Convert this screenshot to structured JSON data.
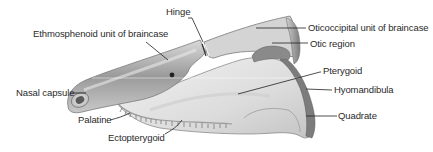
{
  "diagram": {
    "labels": [
      {
        "id": "hinge",
        "text": "Hinge",
        "x": 166,
        "y": 11
      },
      {
        "id": "ethmosphenoid",
        "text": "Ethmosphenoid unit of braincase",
        "x": 33,
        "y": 32
      },
      {
        "id": "oticoccipital",
        "text": "Oticoccipital unit of braincase",
        "x": 308,
        "y": 22
      },
      {
        "id": "otic-region",
        "text": "Otic region",
        "x": 310,
        "y": 38
      },
      {
        "id": "pterygoid",
        "text": "Pterygoid",
        "x": 323,
        "y": 65
      },
      {
        "id": "hyomandibula",
        "text": "Hyomandibula",
        "x": 334,
        "y": 84
      },
      {
        "id": "quadrate",
        "text": "Quadrate",
        "x": 338,
        "y": 110
      },
      {
        "id": "nasal-capsule",
        "text": "Nasal capsule",
        "x": 16,
        "y": 88
      },
      {
        "id": "palatine",
        "text": "Palatine",
        "x": 78,
        "y": 114
      },
      {
        "id": "ectopterygoid",
        "text": "Ectopterygoid",
        "x": 108,
        "y": 133
      }
    ],
    "colors": {
      "label_text": "#2a2a2a",
      "leader_line": "#222222",
      "bone_light": "#e6e6e6",
      "bone_mid": "#b8b8b8",
      "bone_dark": "#6e6e6e"
    }
  }
}
